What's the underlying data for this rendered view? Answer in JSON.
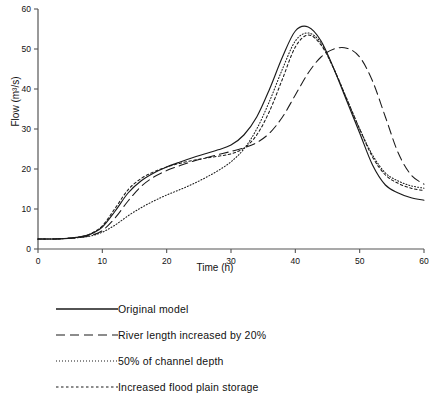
{
  "chart_data": {
    "type": "line",
    "title": "",
    "xlabel": "Time (h)",
    "ylabel": "Flow (m³/s)",
    "xlim": [
      0,
      60
    ],
    "ylim": [
      0,
      60
    ],
    "xticks": [
      0,
      10,
      20,
      30,
      40,
      50,
      60
    ],
    "yticks": [
      0,
      10,
      20,
      30,
      40,
      50,
      60
    ],
    "grid": false,
    "legend_position": "below-plot",
    "x": [
      0,
      2,
      4,
      6,
      8,
      10,
      12,
      14,
      16,
      18,
      20,
      22,
      24,
      26,
      28,
      30,
      32,
      34,
      36,
      38,
      40,
      42,
      44,
      46,
      48,
      50,
      52,
      54,
      56,
      58,
      60
    ],
    "series": [
      {
        "name": "Original model",
        "style": "solid",
        "values": [
          2.5,
          2.5,
          2.6,
          2.9,
          3.6,
          5.5,
          9.5,
          14.0,
          17.0,
          19.0,
          20.5,
          21.7,
          22.8,
          23.8,
          24.8,
          26.0,
          28.5,
          33.0,
          40.0,
          48.0,
          54.5,
          55.5,
          52.0,
          45.0,
          37.0,
          29.0,
          21.0,
          16.0,
          14.0,
          12.8,
          12.2
        ]
      },
      {
        "name": "River length increased by 20%",
        "style": "dashed",
        "values": [
          2.5,
          2.5,
          2.6,
          2.8,
          3.3,
          4.6,
          7.8,
          12.0,
          15.6,
          18.0,
          19.6,
          20.8,
          21.9,
          22.8,
          23.6,
          24.4,
          25.3,
          26.6,
          29.0,
          33.0,
          38.5,
          44.0,
          48.0,
          50.0,
          50.2,
          48.0,
          42.0,
          33.0,
          24.0,
          18.5,
          16.2
        ]
      },
      {
        "name": "50% of channel depth",
        "style": "dotted-fine",
        "values": [
          2.5,
          2.5,
          2.6,
          2.8,
          3.2,
          4.2,
          6.0,
          8.3,
          10.3,
          12.0,
          13.5,
          14.8,
          16.2,
          17.8,
          19.6,
          21.8,
          25.0,
          30.0,
          37.0,
          45.0,
          52.0,
          54.0,
          51.5,
          45.0,
          37.5,
          30.0,
          23.5,
          19.0,
          17.0,
          15.8,
          15.2
        ]
      },
      {
        "name": "Increased flood plain storage",
        "style": "dotted-coarse",
        "values": [
          2.5,
          2.5,
          2.6,
          2.9,
          3.7,
          5.8,
          10.2,
          14.8,
          17.6,
          19.3,
          20.5,
          21.4,
          22.1,
          22.7,
          23.2,
          23.8,
          25.2,
          28.5,
          34.5,
          42.5,
          50.5,
          53.5,
          51.0,
          45.0,
          37.5,
          30.0,
          23.0,
          18.5,
          16.4,
          15.2,
          14.6
        ]
      }
    ]
  },
  "legend": {
    "items": [
      {
        "label": "Original model",
        "style": "solid"
      },
      {
        "label": "River length increased by 20%",
        "style": "dashed"
      },
      {
        "label": "50% of channel depth",
        "style": "dotted-fine"
      },
      {
        "label": "Increased flood plain storage",
        "style": "dotted-coarse"
      }
    ]
  },
  "colors": {
    "line": "#1a1a1a",
    "axis": "#555555",
    "text": "#111111"
  }
}
